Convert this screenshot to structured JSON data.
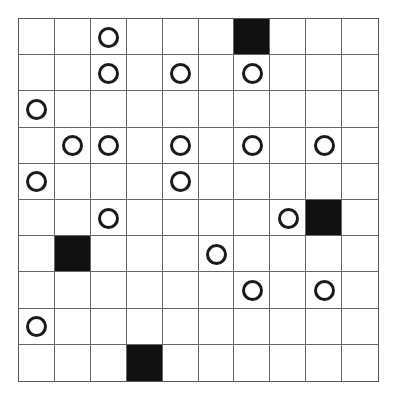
{
  "puzzle": {
    "rows": 10,
    "cols": 10,
    "colors": {
      "black": "#111111",
      "line": "#666666",
      "circle": "#1a1a1a"
    },
    "grid": [
      ".",
      ".",
      "O",
      ".",
      ".",
      ".",
      "B",
      ".",
      ".",
      ".",
      ".",
      ".",
      "O",
      ".",
      "O",
      ".",
      "O",
      ".",
      ".",
      ".",
      "O",
      ".",
      ".",
      ".",
      ".",
      ".",
      ".",
      ".",
      ".",
      ".",
      ".",
      "O",
      "O",
      ".",
      "O",
      ".",
      "O",
      ".",
      "O",
      ".",
      "O",
      ".",
      ".",
      ".",
      "O",
      ".",
      ".",
      ".",
      ".",
      ".",
      ".",
      ".",
      "O",
      ".",
      ".",
      ".",
      ".",
      "O",
      "B",
      ".",
      ".",
      "B",
      ".",
      ".",
      ".",
      "O",
      ".",
      ".",
      ".",
      ".",
      ".",
      ".",
      ".",
      ".",
      ".",
      ".",
      "O",
      ".",
      "O",
      ".",
      "O",
      ".",
      ".",
      ".",
      ".",
      ".",
      ".",
      ".",
      ".",
      ".",
      ".",
      ".",
      ".",
      "B",
      ".",
      ".",
      ".",
      ".",
      ".",
      "."
    ],
    "legend": {
      "O": "white-circle",
      "B": "black-square",
      ".": "empty"
    }
  }
}
